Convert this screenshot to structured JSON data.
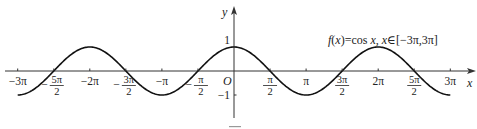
{
  "chart_data": {
    "type": "line",
    "title": "f(x)=cos x, x∈[−3π,3π]",
    "title_parts": {
      "func": "f",
      "arg": "(x)",
      "rhs": "=cos ",
      "var": "x",
      "sep": ", ",
      "var2": "x",
      "domain": "∈[−3π,3π]"
    },
    "xlabel": "x",
    "ylabel": "y",
    "origin_label": "O",
    "function": "cos(x)",
    "xlim": [
      -9.42478,
      9.42478
    ],
    "ylim": [
      -1,
      1
    ],
    "grid": false,
    "legend": null,
    "x_ticks": [
      {
        "value": -9.42478,
        "label": "−3π",
        "frac": false
      },
      {
        "value": -7.85398,
        "label": "−5π/2",
        "frac": true,
        "sign": "−",
        "num": "5π",
        "den": "2"
      },
      {
        "value": -6.28319,
        "label": "−2π",
        "frac": false
      },
      {
        "value": -4.71239,
        "label": "−3π/2",
        "frac": true,
        "sign": "−",
        "num": "3π",
        "den": "2"
      },
      {
        "value": -3.14159,
        "label": "−π",
        "frac": false
      },
      {
        "value": -1.5708,
        "label": "−π/2",
        "frac": true,
        "sign": "−",
        "num": "π",
        "den": "2"
      },
      {
        "value": 1.5708,
        "label": "π/2",
        "frac": true,
        "sign": "",
        "num": "π",
        "den": "2"
      },
      {
        "value": 3.14159,
        "label": "π",
        "frac": false
      },
      {
        "value": 4.71239,
        "label": "3π/2",
        "frac": true,
        "sign": "",
        "num": "3π",
        "den": "2"
      },
      {
        "value": 6.28319,
        "label": "2π",
        "frac": false
      },
      {
        "value": 7.85398,
        "label": "5π/2",
        "frac": true,
        "sign": "",
        "num": "5π",
        "den": "2"
      },
      {
        "value": 9.42478,
        "label": "3π",
        "frac": false
      }
    ],
    "y_ticks": [
      {
        "value": 1,
        "label": "1"
      },
      {
        "value": -1,
        "label": "−1"
      }
    ],
    "key_points": [
      {
        "x": "−3π",
        "y": -1
      },
      {
        "x": "−5π/2",
        "y": 0
      },
      {
        "x": "−2π",
        "y": 1
      },
      {
        "x": "−3π/2",
        "y": 0
      },
      {
        "x": "−π",
        "y": -1
      },
      {
        "x": "−π/2",
        "y": 0
      },
      {
        "x": "0",
        "y": 1
      },
      {
        "x": "π/2",
        "y": 0
      },
      {
        "x": "π",
        "y": -1
      },
      {
        "x": "3π/2",
        "y": 0
      },
      {
        "x": "2π",
        "y": 1
      },
      {
        "x": "5π/2",
        "y": 0
      },
      {
        "x": "3π",
        "y": -1
      }
    ],
    "colors": {
      "curve": "#111111",
      "axis": "#333333",
      "text": "#222222"
    }
  },
  "layout": {
    "origin_px": [
      234,
      71
    ],
    "px_per_pi": 72.1,
    "px_per_unit_y": 24,
    "x_axis_px": [
      5,
      476
    ],
    "y_axis_px": [
      118,
      6
    ]
  }
}
